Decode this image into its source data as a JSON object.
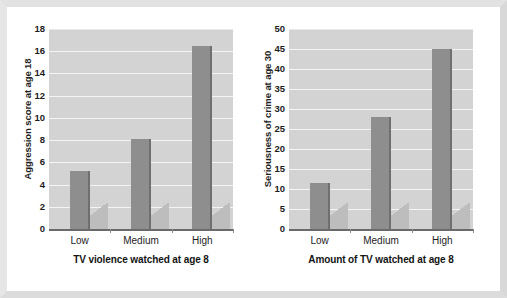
{
  "chart_data": [
    {
      "type": "bar",
      "id": "aggression-chart",
      "title": "",
      "categories": [
        "Low",
        "Medium",
        "High"
      ],
      "values": [
        5.2,
        8.1,
        16.5
      ],
      "xlabel": "TV violence watched at age 8",
      "ylabel": "Aggression score at age 18",
      "ylim": [
        0,
        18
      ],
      "ytick_step": 2,
      "yticks": [
        0,
        2,
        4,
        6,
        8,
        10,
        12,
        14,
        16,
        18
      ],
      "ytick_labels": [
        "0",
        "2",
        "4",
        "6",
        "8",
        "10",
        "12",
        "14",
        "16",
        "18"
      ],
      "grid": true,
      "legend": "none",
      "bar_color": "#8e8e8e",
      "plot_background": "#d3d3d3",
      "gridline_color": "#f4f4f4"
    },
    {
      "type": "bar",
      "id": "crime-chart",
      "title": "",
      "categories": [
        "Low",
        "Medium",
        "High"
      ],
      "values": [
        11.5,
        28,
        45
      ],
      "xlabel": "Amount of TV watched at age 8",
      "ylabel": "Seriousness of crime at age 30",
      "ylim": [
        0,
        50
      ],
      "ytick_step": 5,
      "yticks": [
        0,
        5,
        10,
        15,
        20,
        25,
        30,
        35,
        40,
        45,
        50
      ],
      "ytick_labels": [
        "0",
        "5",
        "10",
        "15",
        "20",
        "25",
        "30",
        "35",
        "40",
        "45",
        "50"
      ],
      "grid": true,
      "legend": "none",
      "bar_color": "#8e8e8e",
      "plot_background": "#d3d3d3",
      "gridline_color": "#f4f4f4"
    }
  ]
}
